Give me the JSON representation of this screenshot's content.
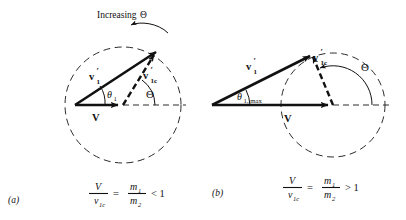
{
  "figure": {
    "background_color": "#ffffff",
    "ink_color": "#111111",
    "annotation": {
      "increasing_label": "Increasing",
      "increasing_symbol": "Θ",
      "arrow_name": "increasing-theta-arrow"
    },
    "panels": [
      {
        "id": "a",
        "panel_label": "(a)",
        "vectors": [
          {
            "name": "V",
            "label": "V",
            "style": "solid",
            "subscript": "",
            "prime": false
          },
          {
            "name": "v1prime",
            "label": "v",
            "style": "solid",
            "subscript": "1",
            "prime": true
          },
          {
            "name": "v1c",
            "label": "v",
            "style": "dashed",
            "subscript": "1c",
            "prime": true
          }
        ],
        "angles": [
          {
            "name": "theta1",
            "symbol": "θ",
            "subscript": "1",
            "vertex": "origin"
          },
          {
            "name": "theta-cm",
            "symbol": "Θ",
            "subscript": "",
            "vertex": "v-tip"
          }
        ],
        "circle": {
          "name": "velocity-circle",
          "style": "dashed",
          "center": "v-tip",
          "radius_vs_V": "greater"
        },
        "equation": {
          "numerator_left": "V",
          "denominator_left": "v",
          "denominator_left_sub": "1c",
          "equals": "=",
          "numerator_right": "m",
          "numerator_right_sub": "1",
          "denominator_right": "m",
          "denominator_right_sub": "2",
          "relation": "< 1"
        }
      },
      {
        "id": "b",
        "panel_label": "(b)",
        "vectors": [
          {
            "name": "V",
            "label": "V",
            "style": "solid",
            "subscript": "",
            "prime": false
          },
          {
            "name": "v1prime",
            "label": "v",
            "style": "solid",
            "subscript": "1",
            "prime": true
          },
          {
            "name": "v1c",
            "label": "v",
            "style": "dashed",
            "subscript": "1c",
            "prime": true
          }
        ],
        "angles": [
          {
            "name": "theta1max",
            "symbol": "θ",
            "subscript": "1, max",
            "vertex": "origin"
          },
          {
            "name": "theta-cm",
            "symbol": "Θ",
            "subscript": "",
            "vertex": "v-tip"
          }
        ],
        "circle": {
          "name": "velocity-circle",
          "style": "dashed",
          "center": "v-tip",
          "radius_vs_V": "less"
        },
        "equation": {
          "numerator_left": "V",
          "denominator_left": "v",
          "denominator_left_sub": "1c",
          "equals": "=",
          "numerator_right": "m",
          "numerator_right_sub": "1",
          "denominator_right": "m",
          "denominator_right_sub": "2",
          "relation": "> 1"
        }
      }
    ]
  }
}
